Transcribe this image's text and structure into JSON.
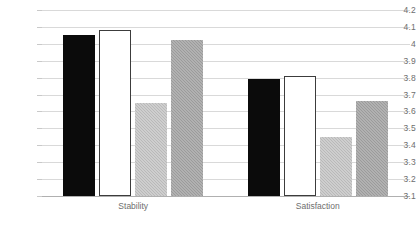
{
  "chart_data": {
    "type": "bar",
    "title": "",
    "subtitle": "",
    "xlabel": "",
    "ylabel": "",
    "categories": [
      "Stability",
      "Satisfaction"
    ],
    "ylim": [
      3.1,
      4.2
    ],
    "ytick_step": 0.1,
    "ytick_labels": [
      "4.2",
      "4.1",
      "4",
      "3.9",
      "3.8",
      "3.7",
      "3.6",
      "3.5",
      "3.4",
      "3.3",
      "3.2",
      "3.1"
    ],
    "ytick_values": [
      4.2,
      4.1,
      4.0,
      3.9,
      3.8,
      3.7,
      3.6,
      3.5,
      3.4,
      3.3,
      3.2,
      3.1
    ],
    "grid": true,
    "grid_axis": "y",
    "legend": false,
    "legend_position": "none",
    "series": [
      {
        "name": "Series 1",
        "style": "black",
        "color": "#0b0b0b",
        "values": [
          4.05,
          3.79
        ]
      },
      {
        "name": "Series 2",
        "style": "white",
        "color": "#ffffff",
        "values": [
          4.08,
          3.81
        ]
      },
      {
        "name": "Series 3",
        "style": "light-gray",
        "color": "#b9b9b9",
        "values": [
          3.65,
          3.45
        ]
      },
      {
        "name": "Series 4",
        "style": "dark-gray",
        "color": "#9b9b9b",
        "values": [
          4.02,
          3.66
        ]
      }
    ]
  },
  "axis": {
    "y_labels": [
      "4.2",
      "4.1",
      "4",
      "3.9",
      "3.8",
      "3.7",
      "3.6",
      "3.5",
      "3.4",
      "3.3",
      "3.2",
      "3.1"
    ],
    "x_labels": [
      "Stability",
      "Satisfaction"
    ]
  },
  "colors": {
    "series_black": "#0b0b0b",
    "series_white": "#ffffff",
    "series_light_gray": "#b9b9b9",
    "series_dark_gray": "#9b9b9b",
    "gridline": "#d9d9d9",
    "axis_text": "#6e6e6e",
    "background": "#ffffff"
  }
}
